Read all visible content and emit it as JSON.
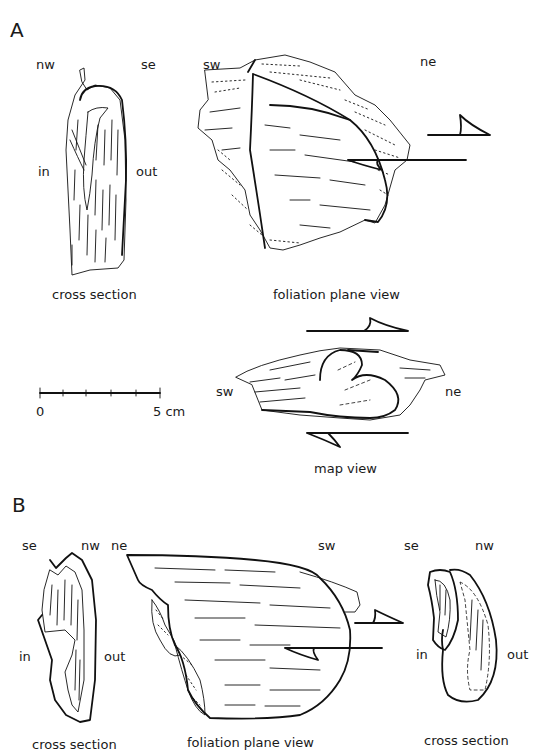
{
  "panels": {
    "A": {
      "label": "A",
      "cross_section": {
        "title": "cross section",
        "orient_left": "nw",
        "orient_right": "se",
        "side_left": "in",
        "side_right": "out"
      },
      "foliation_view": {
        "title": "foliation plane view",
        "orient_left": "sw",
        "orient_right": "ne"
      },
      "map_view": {
        "title": "map view",
        "orient_left": "sw",
        "orient_right": "ne"
      },
      "scale_bar": {
        "start_label": "0",
        "end_label": "5 cm",
        "ticks": 5
      }
    },
    "B": {
      "label": "B",
      "cross_section_left": {
        "title": "cross section",
        "orient_left": "se",
        "orient_right": "nw",
        "side_left": "in",
        "side_right": "out"
      },
      "foliation_view": {
        "title": "foliation plane view",
        "orient_left": "ne",
        "orient_right": "sw"
      },
      "cross_section_right": {
        "title": "cross section",
        "orient_left": "se",
        "orient_right": "nw",
        "side_left": "in",
        "side_right": "out"
      }
    }
  }
}
